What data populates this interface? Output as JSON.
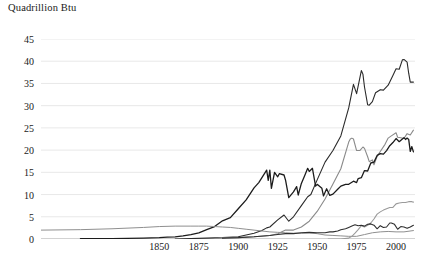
{
  "chart_data": {
    "type": "line",
    "title": "Quadrillion Btu",
    "xlabel": "",
    "ylabel": "Quadrillion Btu",
    "xlim": [
      1775,
      2012
    ],
    "ylim": [
      0,
      45
    ],
    "grid": true,
    "legend": "none",
    "xticks": [
      1850,
      1875,
      1900,
      1925,
      1950,
      1975,
      2000
    ],
    "yticks": [
      0,
      5,
      10,
      15,
      20,
      25,
      30,
      35,
      40,
      45
    ],
    "colors": {
      "petroleum": "#2b2b2b",
      "natural_gas": "#8a8a8a",
      "coal": "#1c1c1c",
      "wood": "#8f8f8f",
      "nuclear": "#9a9a9a",
      "hydro": "#2f2f2f",
      "gridline": "#e2e2e2",
      "axis": "#9a9a9a"
    },
    "series": [
      {
        "name": "Petroleum",
        "color": "#2b2b2b",
        "width": 1.1,
        "points": [
          [
            1860,
            0.0
          ],
          [
            1870,
            0.1
          ],
          [
            1880,
            0.2
          ],
          [
            1890,
            0.3
          ],
          [
            1900,
            0.5
          ],
          [
            1905,
            0.9
          ],
          [
            1910,
            1.3
          ],
          [
            1915,
            1.9
          ],
          [
            1918,
            2.5
          ],
          [
            1920,
            2.7
          ],
          [
            1925,
            4.3
          ],
          [
            1929,
            5.4
          ],
          [
            1932,
            4.0
          ],
          [
            1935,
            5.0
          ],
          [
            1940,
            7.5
          ],
          [
            1944,
            9.5
          ],
          [
            1946,
            10.0
          ],
          [
            1950,
            13.3
          ],
          [
            1955,
            17.3
          ],
          [
            1960,
            19.9
          ],
          [
            1965,
            23.2
          ],
          [
            1970,
            29.5
          ],
          [
            1973,
            34.8
          ],
          [
            1975,
            32.7
          ],
          [
            1978,
            37.9
          ],
          [
            1979,
            37.1
          ],
          [
            1980,
            34.2
          ],
          [
            1982,
            30.2
          ],
          [
            1983,
            30.1
          ],
          [
            1985,
            30.9
          ],
          [
            1987,
            32.9
          ],
          [
            1990,
            33.6
          ],
          [
            1992,
            33.5
          ],
          [
            1995,
            34.6
          ],
          [
            1998,
            36.8
          ],
          [
            2000,
            38.3
          ],
          [
            2002,
            38.2
          ],
          [
            2004,
            40.3
          ],
          [
            2005,
            40.4
          ],
          [
            2007,
            39.8
          ],
          [
            2008,
            37.3
          ],
          [
            2009,
            35.3
          ],
          [
            2011,
            35.3
          ]
        ]
      },
      {
        "name": "Natural Gas",
        "color": "#8a8a8a",
        "width": 1.1,
        "points": [
          [
            1885,
            0.0
          ],
          [
            1890,
            0.3
          ],
          [
            1900,
            0.3
          ],
          [
            1910,
            0.5
          ],
          [
            1920,
            0.8
          ],
          [
            1925,
            1.2
          ],
          [
            1930,
            2.0
          ],
          [
            1935,
            2.0
          ],
          [
            1940,
            2.7
          ],
          [
            1945,
            4.0
          ],
          [
            1950,
            6.2
          ],
          [
            1955,
            9.0
          ],
          [
            1960,
            12.4
          ],
          [
            1965,
            15.8
          ],
          [
            1970,
            21.8
          ],
          [
            1971,
            22.5
          ],
          [
            1972,
            22.7
          ],
          [
            1973,
            22.5
          ],
          [
            1975,
            19.9
          ],
          [
            1977,
            19.9
          ],
          [
            1979,
            20.7
          ],
          [
            1980,
            20.4
          ],
          [
            1982,
            18.5
          ],
          [
            1983,
            17.4
          ],
          [
            1985,
            17.8
          ],
          [
            1986,
            16.7
          ],
          [
            1988,
            18.6
          ],
          [
            1990,
            19.7
          ],
          [
            1993,
            21.3
          ],
          [
            1995,
            22.7
          ],
          [
            1997,
            23.2
          ],
          [
            2000,
            23.9
          ],
          [
            2001,
            22.9
          ],
          [
            2003,
            22.8
          ],
          [
            2005,
            22.6
          ],
          [
            2007,
            23.7
          ],
          [
            2009,
            23.4
          ],
          [
            2011,
            24.5
          ]
        ]
      },
      {
        "name": "Coal",
        "color": "#1c1c1c",
        "width": 1.3,
        "points": [
          [
            1800,
            0.1
          ],
          [
            1820,
            0.1
          ],
          [
            1840,
            0.2
          ],
          [
            1850,
            0.3
          ],
          [
            1855,
            0.4
          ],
          [
            1860,
            0.5
          ],
          [
            1865,
            0.7
          ],
          [
            1870,
            1.0
          ],
          [
            1875,
            1.4
          ],
          [
            1880,
            2.1
          ],
          [
            1885,
            2.8
          ],
          [
            1890,
            4.1
          ],
          [
            1895,
            4.8
          ],
          [
            1900,
            6.8
          ],
          [
            1905,
            8.8
          ],
          [
            1910,
            11.5
          ],
          [
            1913,
            12.7
          ],
          [
            1918,
            15.5
          ],
          [
            1919,
            13.2
          ],
          [
            1920,
            15.5
          ],
          [
            1921,
            11.4
          ],
          [
            1923,
            15.0
          ],
          [
            1925,
            14.0
          ],
          [
            1926,
            14.7
          ],
          [
            1929,
            14.4
          ],
          [
            1930,
            13.2
          ],
          [
            1932,
            9.3
          ],
          [
            1935,
            10.6
          ],
          [
            1937,
            11.8
          ],
          [
            1938,
            9.9
          ],
          [
            1940,
            12.5
          ],
          [
            1942,
            14.2
          ],
          [
            1944,
            15.9
          ],
          [
            1945,
            15.2
          ],
          [
            1947,
            15.9
          ],
          [
            1949,
            11.9
          ],
          [
            1950,
            12.3
          ],
          [
            1953,
            11.4
          ],
          [
            1954,
            9.7
          ],
          [
            1956,
            11.3
          ],
          [
            1958,
            9.8
          ],
          [
            1960,
            10.1
          ],
          [
            1963,
            11.2
          ],
          [
            1965,
            11.9
          ],
          [
            1968,
            12.3
          ],
          [
            1970,
            12.3
          ],
          [
            1973,
            13.0
          ],
          [
            1975,
            12.7
          ],
          [
            1976,
            13.6
          ],
          [
            1978,
            13.8
          ],
          [
            1980,
            15.4
          ],
          [
            1982,
            15.3
          ],
          [
            1984,
            17.1
          ],
          [
            1986,
            17.3
          ],
          [
            1988,
            18.8
          ],
          [
            1990,
            19.2
          ],
          [
            1992,
            19.1
          ],
          [
            1994,
            19.9
          ],
          [
            1996,
            21.0
          ],
          [
            1998,
            21.7
          ],
          [
            2000,
            22.6
          ],
          [
            2002,
            21.9
          ],
          [
            2004,
            22.5
          ],
          [
            2005,
            22.8
          ],
          [
            2006,
            22.4
          ],
          [
            2007,
            22.7
          ],
          [
            2008,
            22.4
          ],
          [
            2009,
            19.7
          ],
          [
            2010,
            20.8
          ],
          [
            2011,
            19.6
          ]
        ]
      },
      {
        "name": "Wood",
        "color": "#8f8f8f",
        "width": 1.0,
        "points": [
          [
            1775,
            2.0
          ],
          [
            1800,
            2.1
          ],
          [
            1820,
            2.3
          ],
          [
            1840,
            2.6
          ],
          [
            1850,
            2.8
          ],
          [
            1860,
            2.9
          ],
          [
            1870,
            2.9
          ],
          [
            1875,
            2.9
          ],
          [
            1880,
            2.9
          ],
          [
            1885,
            2.8
          ],
          [
            1890,
            2.7
          ],
          [
            1895,
            2.6
          ],
          [
            1900,
            2.4
          ],
          [
            1905,
            2.2
          ],
          [
            1910,
            2.0
          ],
          [
            1915,
            1.8
          ],
          [
            1920,
            1.6
          ],
          [
            1925,
            1.5
          ],
          [
            1930,
            1.4
          ],
          [
            1935,
            1.3
          ],
          [
            1940,
            1.3
          ],
          [
            1945,
            1.4
          ],
          [
            1950,
            1.2
          ],
          [
            1955,
            0.9
          ],
          [
            1960,
            0.8
          ],
          [
            1965,
            0.7
          ],
          [
            1970,
            0.6
          ],
          [
            1975,
            0.6
          ],
          [
            1980,
            1.0
          ],
          [
            1985,
            1.4
          ],
          [
            1990,
            1.6
          ],
          [
            1995,
            1.7
          ],
          [
            2000,
            1.6
          ],
          [
            2005,
            1.6
          ],
          [
            2011,
            1.9
          ]
        ]
      },
      {
        "name": "Nuclear",
        "color": "#9a9a9a",
        "width": 1.1,
        "points": [
          [
            1957,
            0.0
          ],
          [
            1960,
            0.0
          ],
          [
            1965,
            0.0
          ],
          [
            1970,
            0.2
          ],
          [
            1972,
            0.6
          ],
          [
            1974,
            1.3
          ],
          [
            1976,
            2.1
          ],
          [
            1978,
            3.0
          ],
          [
            1980,
            2.7
          ],
          [
            1982,
            3.1
          ],
          [
            1984,
            3.6
          ],
          [
            1986,
            4.5
          ],
          [
            1988,
            5.6
          ],
          [
            1990,
            6.1
          ],
          [
            1992,
            6.5
          ],
          [
            1994,
            6.8
          ],
          [
            1996,
            7.1
          ],
          [
            1998,
            7.1
          ],
          [
            2000,
            7.9
          ],
          [
            2002,
            8.1
          ],
          [
            2004,
            8.2
          ],
          [
            2006,
            8.2
          ],
          [
            2008,
            8.4
          ],
          [
            2010,
            8.4
          ],
          [
            2011,
            8.3
          ]
        ]
      },
      {
        "name": "Hydroelectric",
        "color": "#2f2f2f",
        "width": 1.1,
        "points": [
          [
            1890,
            0.2
          ],
          [
            1900,
            0.3
          ],
          [
            1910,
            0.5
          ],
          [
            1920,
            0.8
          ],
          [
            1925,
            1.0
          ],
          [
            1930,
            1.2
          ],
          [
            1935,
            1.2
          ],
          [
            1940,
            1.4
          ],
          [
            1945,
            1.5
          ],
          [
            1950,
            1.4
          ],
          [
            1953,
            1.4
          ],
          [
            1955,
            1.4
          ],
          [
            1958,
            1.6
          ],
          [
            1960,
            1.6
          ],
          [
            1963,
            1.8
          ],
          [
            1965,
            2.1
          ],
          [
            1968,
            2.3
          ],
          [
            1970,
            2.6
          ],
          [
            1972,
            2.9
          ],
          [
            1974,
            3.2
          ],
          [
            1976,
            3.0
          ],
          [
            1978,
            3.1
          ],
          [
            1980,
            2.9
          ],
          [
            1982,
            3.3
          ],
          [
            1984,
            3.4
          ],
          [
            1986,
            3.1
          ],
          [
            1988,
            2.3
          ],
          [
            1990,
            3.0
          ],
          [
            1992,
            2.6
          ],
          [
            1994,
            2.7
          ],
          [
            1996,
            3.6
          ],
          [
            1997,
            3.6
          ],
          [
            1999,
            3.3
          ],
          [
            2001,
            2.2
          ],
          [
            2003,
            2.8
          ],
          [
            2005,
            2.7
          ],
          [
            2007,
            2.4
          ],
          [
            2009,
            2.7
          ],
          [
            2011,
            3.1
          ]
        ]
      }
    ]
  }
}
